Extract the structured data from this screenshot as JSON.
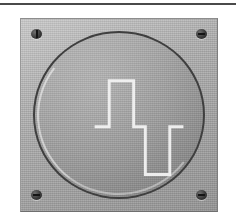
{
  "scene": {
    "title": "Square-wave control plate",
    "description": "Grey metal face plate with four corner screws and a recessed round dial engraved with a white square-wave pulse symbol",
    "background_color": "#ffffff",
    "width": 236,
    "height": 223
  },
  "top_rule": {
    "name": "horizontal-rule",
    "color": "#4a4a4a"
  },
  "plate": {
    "label": "face-plate",
    "color": "#b0b0b0",
    "border_color": "#8d8d8d",
    "x": 20,
    "y": 18,
    "width": 198,
    "height": 194
  },
  "screws": [
    {
      "id": "screw-tl",
      "position": "top-left",
      "slot": "vertical",
      "color": "#3a3a3a"
    },
    {
      "id": "screw-tr",
      "position": "top-right",
      "slot": "horizontal",
      "color": "#3a3a3a"
    },
    {
      "id": "screw-bl",
      "position": "bottom-left",
      "slot": "horizontal",
      "color": "#3a3a3a"
    },
    {
      "id": "screw-br",
      "position": "bottom-right",
      "slot": "horizontal",
      "color": "#3a3a3a"
    }
  ],
  "dial": {
    "label": "round-dial",
    "face_color": "#a3a3a3",
    "rim_color": "#3f3f3f",
    "diameter": 172
  },
  "symbol": {
    "label": "square-wave-pulse",
    "stroke_color": "#f2f2f2",
    "stroke_width": 3,
    "points": "61,96 76,96 76,49 101,49 101,96 113,96 113,145 138,145 138,96 152,96"
  }
}
